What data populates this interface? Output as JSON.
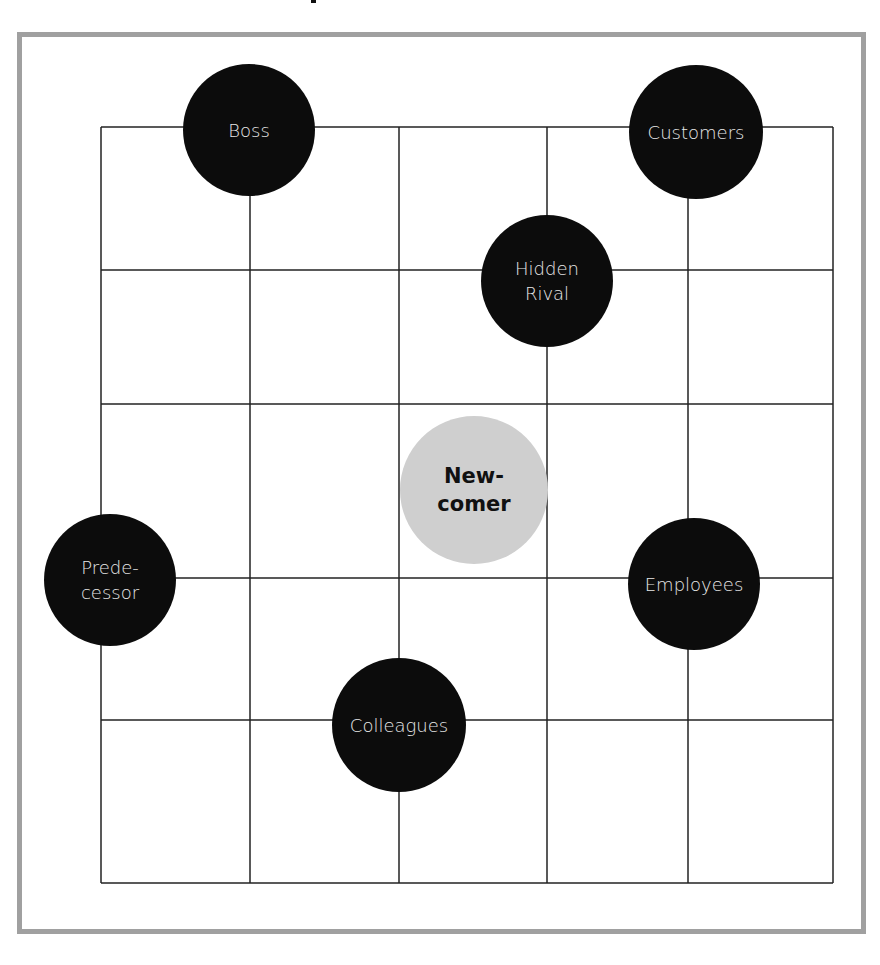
{
  "diagram": {
    "type": "stakeholder-grid",
    "colors": {
      "frame": "#a0a0a0",
      "grid_line": "#222222",
      "stakeholder_fill": "#0c0c0c",
      "stakeholder_text": "#e8e8e8",
      "center_fill": "#cfcfcf",
      "center_text": "#111111"
    },
    "grid": {
      "x_lines": [
        101,
        250,
        399,
        547,
        688,
        833
      ],
      "y_lines": [
        127,
        270,
        404,
        578,
        720,
        883
      ]
    },
    "center": {
      "label": "New-\ncomer",
      "cx": 474,
      "cy": 490,
      "r": 74
    },
    "stakeholders": [
      {
        "label": "Boss",
        "cx": 249,
        "cy": 130,
        "r": 66
      },
      {
        "label": "Customers",
        "cx": 696,
        "cy": 132,
        "r": 67
      },
      {
        "label": "Hidden\nRival",
        "cx": 547,
        "cy": 281,
        "r": 66
      },
      {
        "label": "Prede-\ncessor",
        "cx": 110,
        "cy": 580,
        "r": 66
      },
      {
        "label": "Employees",
        "cx": 694,
        "cy": 584,
        "r": 66
      },
      {
        "label": "Colleagues",
        "cx": 399,
        "cy": 725,
        "r": 67
      }
    ]
  }
}
